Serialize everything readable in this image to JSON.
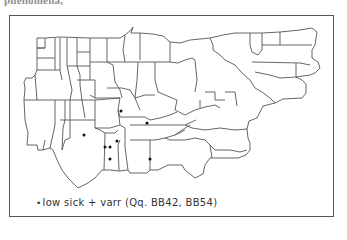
{
  "top_text_fragment": "phenomena,",
  "figure": {
    "type": "dot distribution map",
    "region_count_note": "US eastern states / counties outline",
    "legend": {
      "bullet": "•",
      "label": "low sick + varr (Qq. BB42, BB54)"
    },
    "points": [
      {
        "x": 121,
        "y": 111
      },
      {
        "x": 147,
        "y": 123
      },
      {
        "x": 84,
        "y": 135
      },
      {
        "x": 105,
        "y": 147
      },
      {
        "x": 110,
        "y": 147
      },
      {
        "x": 117,
        "y": 141
      },
      {
        "x": 110,
        "y": 159
      },
      {
        "x": 150,
        "y": 159
      }
    ],
    "colors": {
      "line": "#555555",
      "dot": "#111111",
      "background": "#ffffff"
    }
  }
}
